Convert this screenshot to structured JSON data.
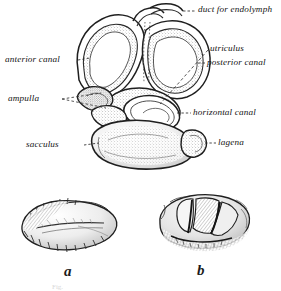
{
  "figure": {
    "kind": "anatomical-engraving",
    "background_color": "#ffffff",
    "ink_color": "#1a1a1a"
  },
  "labyrinth": {
    "labels": [
      {
        "key": "duct_for_endolymph",
        "text": "duct for endolymph",
        "side": "right"
      },
      {
        "key": "utriculus",
        "text": "utriculus",
        "side": "right"
      },
      {
        "key": "posterior_canal",
        "text": "posterior canal",
        "side": "right"
      },
      {
        "key": "horizontal_canal",
        "text": "horizontal canal",
        "side": "right"
      },
      {
        "key": "lagena",
        "text": "lagena",
        "side": "right"
      },
      {
        "key": "anterior_canal",
        "text": "anterior canal",
        "side": "left"
      },
      {
        "key": "ampulla",
        "text": "ampulla",
        "side": "left"
      },
      {
        "key": "sacculus",
        "text": "sacculus",
        "side": "left"
      }
    ]
  },
  "specimens": {
    "items": [
      {
        "key": "a",
        "letter": "a",
        "description": "scalloped leaf-shaped otolith, sagitta in profile"
      },
      {
        "key": "b",
        "letter": "b",
        "description": "rounded ridged otolith, dorsal aspect"
      }
    ]
  },
  "caption": {
    "text": "Fig."
  }
}
